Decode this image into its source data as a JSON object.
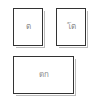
{
  "boxes": [
    {
      "label": "ต"
    },
    {
      "label": "โต"
    },
    {
      "label": "ดก"
    }
  ]
}
